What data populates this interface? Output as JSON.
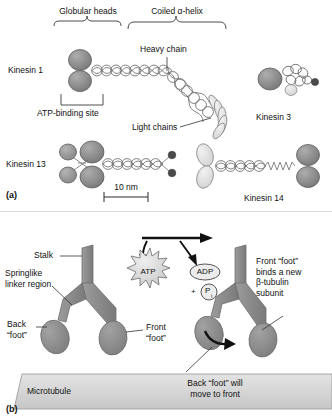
{
  "figure": {
    "title_a": "Kinesin family structural comparison",
    "title_b": "Kinesin walking mechanism along microtubule"
  },
  "panel_a": {
    "id": "(a)",
    "brackets": [
      {
        "label": "Globular heads",
        "x": 88,
        "y": 10,
        "left": 53,
        "right": 123
      },
      {
        "label": "Coiled α-helix",
        "x": 176,
        "y": 10,
        "left": 127,
        "right": 228
      }
    ],
    "molecules": [
      {
        "name": "Kinesin 1",
        "label_x": 8,
        "label_y": 84
      },
      {
        "name": "Kinesin 3",
        "label_x": 256,
        "label_y": 117
      },
      {
        "name": "Kinesin 13",
        "label_x": 6,
        "label_y": 166
      },
      {
        "name": "Kinesin 14",
        "label_x": 244,
        "label_y": 198
      }
    ],
    "annotations": [
      {
        "name": "heavy-chain",
        "text": "Heavy chain",
        "x": 141,
        "y": 44
      },
      {
        "name": "atp-binding-site",
        "text": "ATP-binding site",
        "x": 40,
        "y": 117
      },
      {
        "name": "light-chains",
        "text": "Light chains",
        "x": 134,
        "y": 130
      }
    ],
    "scale_bar": {
      "label": "10 nm",
      "x": 104,
      "y": 185,
      "width": 44
    }
  },
  "panel_b": {
    "id": "(b)",
    "annotations": [
      {
        "name": "stalk",
        "text": "Stalk",
        "x": 35,
        "y": 253
      },
      {
        "name": "springlike-linker-region",
        "text": "Springlike\nlinker region",
        "x": 6,
        "y": 272
      },
      {
        "name": "back-foot",
        "text": "Back\n“foot”",
        "x": 8,
        "y": 324
      },
      {
        "name": "front-foot",
        "text": "Front\n“foot”",
        "x": 147,
        "y": 326
      },
      {
        "name": "front-foot-binds",
        "text": "Front “foot”\nbinds a new\nβ-tubulin\nsubunit",
        "x": 258,
        "y": 262
      },
      {
        "name": "back-foot-will-move",
        "text": "Back “foot” will\nmove to front",
        "x": 174,
        "y": 380
      },
      {
        "name": "microtubule",
        "text": "Microtubule",
        "x": 28,
        "y": 388
      }
    ],
    "reaction": {
      "substrate": "ATP",
      "product": "ADP",
      "phosphate_prefix": "+",
      "phosphate": "P",
      "phosphate_sub": "i"
    }
  },
  "colors": {
    "head_dark": "#8b8b8b",
    "head_mid": "#9a9a9a",
    "light_chain": "#dcdcdc",
    "outline": "#5e5e5e",
    "microtubule": "#d6d6d6",
    "stalk": "#8e8e8e",
    "dot_dark": "#4a4a4a",
    "text": "#111111",
    "leader": "#222222"
  }
}
